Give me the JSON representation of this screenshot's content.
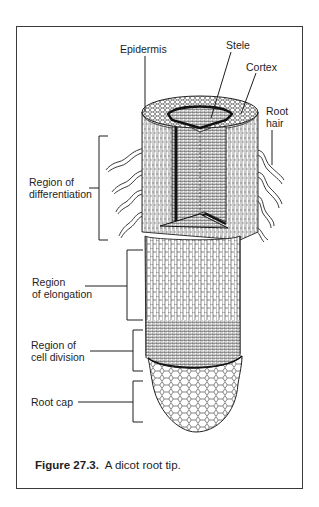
{
  "figure": {
    "number": "Figure 27.3.",
    "caption": "A dicot root tip."
  },
  "labels": {
    "epidermis": "Epidermis",
    "stele": "Stele",
    "cortex": "Cortex",
    "root_hair_1": "Root",
    "root_hair_2": "hair",
    "differentiation_1": "Region of",
    "differentiation_2": "differentiation",
    "elongation_1": "Region",
    "elongation_2": "of elongation",
    "cell_division_1": "Region of",
    "cell_division_2": "cell division",
    "root_cap": "Root cap"
  },
  "colors": {
    "line": "#1e1e1e",
    "frame": "#3a3a3a",
    "background": "#ffffff"
  }
}
